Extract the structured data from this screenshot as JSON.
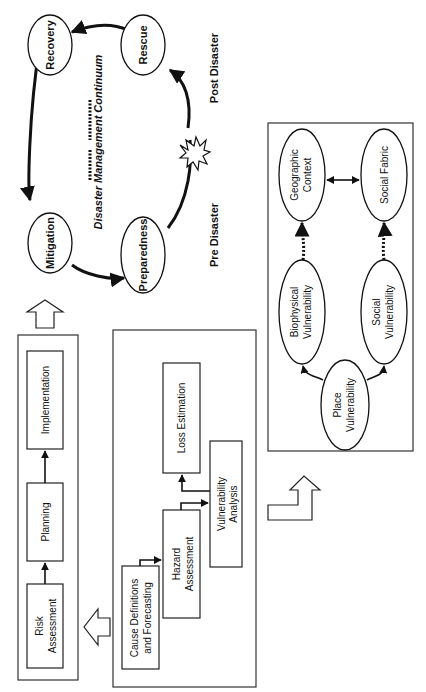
{
  "orientation": "rotated 90deg counter-clockwise",
  "continuum": {
    "title": "Disaster Management Continuum",
    "phases": [
      "Mitigation",
      "Preparedness",
      "Rescue",
      "Recovery"
    ],
    "pre_label": "Pre Disaster",
    "post_label": "Post Disaster"
  },
  "process": {
    "steps": [
      "Risk Assessment",
      "Planning",
      "Implementation"
    ],
    "risk_line1": "Risk",
    "risk_line2": "Assessment"
  },
  "risk_assessment": {
    "cause_line1": "Cause Definitions",
    "cause_line2": "and Forecasting",
    "hazard_line1": "Hazard",
    "hazard_line2": "Assessment",
    "vuln_line1": "Vulnerability",
    "vuln_line2": "Analysis",
    "loss": "Loss Estimation"
  },
  "vulnerability": {
    "place_line1": "Place",
    "place_line2": "Vulnerability",
    "bio_line1": "Biophysical",
    "bio_line2": "Vulnerability",
    "social_line1": "Social",
    "social_line2": "Vulnerability",
    "geo_line1": "Geographic",
    "geo_line2": "Context",
    "fabric": "Social Fabric"
  }
}
